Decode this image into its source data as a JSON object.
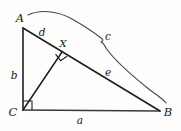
{
  "figure": {
    "background_color": "#fdfdfc",
    "stroke_color": "#1f1f1f",
    "brace_color": "#4a4a48"
  },
  "vertices": {
    "a": {
      "label": "A",
      "x": 23,
      "y": 28,
      "label_x": 20,
      "label_y": 19
    },
    "b": {
      "label": "B",
      "x": 160,
      "y": 111,
      "label_x": 168,
      "label_y": 113
    },
    "c": {
      "label": "C",
      "x": 23,
      "y": 110,
      "label_x": 13,
      "label_y": 113
    },
    "x": {
      "label": "X",
      "x": 62,
      "y": 52,
      "label_x": 63,
      "label_y": 44
    }
  },
  "segments": {
    "leg_vertical": {
      "label": "b",
      "label_x": 14,
      "label_y": 76
    },
    "leg_base": {
      "label": "a",
      "label_x": 80,
      "label_y": 121
    },
    "hyp_upper": {
      "label": "d",
      "label_x": 42,
      "label_y": 33
    },
    "hyp_lower": {
      "label": "e",
      "label_x": 108,
      "label_y": 73
    },
    "hypotenuse_brace": {
      "label": "c",
      "label_x": 108,
      "label_y": 37
    }
  },
  "marks": {
    "right_angle_at_c": "right-angle-square",
    "right_angle_at_x": "right-angle-square"
  }
}
